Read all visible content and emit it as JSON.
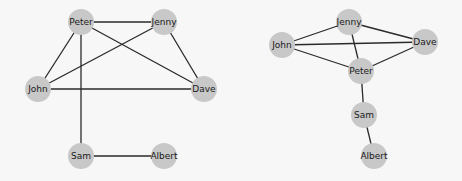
{
  "graphs": [
    {
      "id": "left-graph",
      "nodes": [
        {
          "label": "Peter",
          "x": 81,
          "y": 22
        },
        {
          "label": "Jenny",
          "x": 164,
          "y": 22
        },
        {
          "label": "John",
          "x": 38,
          "y": 89
        },
        {
          "label": "Dave",
          "x": 204,
          "y": 89
        },
        {
          "label": "Sam",
          "x": 81,
          "y": 156
        },
        {
          "label": "Albert",
          "x": 164,
          "y": 156
        }
      ],
      "edges": [
        [
          "Peter",
          "Jenny"
        ],
        [
          "Peter",
          "John"
        ],
        [
          "Peter",
          "Dave"
        ],
        [
          "Peter",
          "Sam"
        ],
        [
          "Jenny",
          "John"
        ],
        [
          "Jenny",
          "Dave"
        ],
        [
          "John",
          "Dave"
        ],
        [
          "Sam",
          "Albert"
        ]
      ]
    },
    {
      "id": "right-graph",
      "nodes": [
        {
          "label": "Jenny",
          "x": 349,
          "y": 22
        },
        {
          "label": "John",
          "x": 282,
          "y": 45
        },
        {
          "label": "Dave",
          "x": 425,
          "y": 42
        },
        {
          "label": "Peter",
          "x": 361,
          "y": 71
        },
        {
          "label": "Sam",
          "x": 364,
          "y": 115
        },
        {
          "label": "Albert",
          "x": 374,
          "y": 156
        }
      ],
      "edges": [
        [
          "Jenny",
          "John"
        ],
        [
          "Jenny",
          "Dave"
        ],
        [
          "Jenny",
          "Peter"
        ],
        [
          "John",
          "Dave"
        ],
        [
          "John",
          "Peter"
        ],
        [
          "Dave",
          "Peter"
        ],
        [
          "Peter",
          "Sam"
        ],
        [
          "Sam",
          "Albert"
        ]
      ]
    }
  ],
  "style": {
    "node_color": "#c8c8c8",
    "edge_color": "#2a2a2a",
    "node_radius": 13,
    "background": "#f7f7f7"
  }
}
